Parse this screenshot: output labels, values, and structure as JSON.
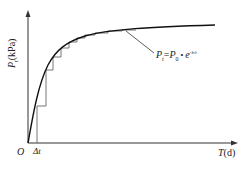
{
  "diagram": {
    "y_axis_label": "P",
    "y_axis_sub": "t",
    "y_axis_unit": "(kPa)",
    "x_axis_label": "T",
    "x_axis_unit": "(d)",
    "origin_label": "O",
    "delta_label": "Δt",
    "formula": {
      "lhs": "P",
      "lhs_sub": "t",
      "eq": "=",
      "rhs": "P",
      "rhs_sub": "0",
      "dot": " • ",
      "exp_base": "e",
      "exp_power": "-b/t"
    },
    "colors": {
      "line": "#222222",
      "step": "#555555"
    }
  }
}
